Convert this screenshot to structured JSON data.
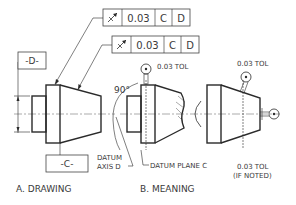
{
  "figure": {
    "drawing": {
      "caption": "A. DRAWING",
      "fcf_top": {
        "symbol": "circular-runout",
        "tolerance": "0.03",
        "datum1": "C",
        "datum2": "D"
      },
      "fcf_bottom": {
        "symbol": "circular-runout",
        "tolerance": "0.03",
        "datum1": "C",
        "datum2": "D"
      },
      "datum_d_label": "-D-",
      "datum_c_label": "-C-",
      "datum_axis_label_1": "DATUM",
      "datum_axis_label_2": "AXIS D"
    },
    "meaning": {
      "caption": "B. MEANING",
      "angle_label": "90°",
      "tol_label_top": "0.03 TOL",
      "tol_label_right": "0.03 TOL",
      "datum_plane_label": "DATUM PLANE C",
      "tol_noted_1": "0.03 TOL",
      "tol_noted_2": "(IF NOTED)"
    }
  }
}
